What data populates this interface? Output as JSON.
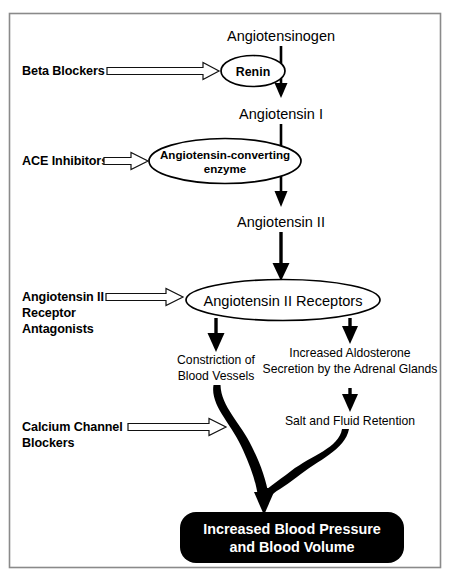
{
  "diagram": {
    "colors": {
      "frame_border": "#8a8a8a",
      "line": "#000000",
      "node_fill": "#ffffff",
      "result_box_fill": "#000000",
      "result_box_text": "#ffffff",
      "hollow_arrow_fill": "#ffffff"
    },
    "pathway_nodes": [
      {
        "id": "angiotensinogen",
        "label": "Angiotensinogen",
        "shape": "text"
      },
      {
        "id": "renin",
        "label": "Renin",
        "shape": "ellipse"
      },
      {
        "id": "angiotensin_1",
        "label": "Angiotensin I",
        "shape": "text"
      },
      {
        "id": "ace",
        "label_line1": "Angiotensin-converting",
        "label_line2": "enzyme",
        "shape": "ellipse"
      },
      {
        "id": "angiotensin_2",
        "label": "Angiotensin II",
        "shape": "text"
      },
      {
        "id": "at2_receptors",
        "label": "Angiotensin II Receptors",
        "shape": "ellipse"
      },
      {
        "id": "constriction",
        "label_line1": "Constriction of",
        "label_line2": "Blood Vessels",
        "shape": "text"
      },
      {
        "id": "aldosterone",
        "label_line1": "Increased Aldosterone",
        "label_line2": "Secretion by the Adrenal Glands",
        "shape": "text"
      },
      {
        "id": "salt_fluid",
        "label": "Salt and Fluid Retention",
        "shape": "text"
      },
      {
        "id": "result",
        "label_line1": "Increased Blood Pressure",
        "label_line2": "and Blood Volume",
        "shape": "rounded-box"
      }
    ],
    "drug_classes": [
      {
        "id": "beta_blockers",
        "lines": [
          "Beta Blockers"
        ],
        "targets": "renin"
      },
      {
        "id": "ace_inhibitors",
        "lines": [
          "ACE Inhibitors"
        ],
        "targets": "ace"
      },
      {
        "id": "arb",
        "lines": [
          "Angiotensin II",
          "Receptor",
          "Antagonists"
        ],
        "targets": "at2_receptors"
      },
      {
        "id": "ccb",
        "lines": [
          "Calcium Channel",
          "Blockers"
        ],
        "targets": "constriction-pathway"
      }
    ],
    "labels": {
      "angiotensinogen": "Angiotensinogen",
      "renin": "Renin",
      "angiotensin_1": "Angiotensin I",
      "ace_line1": "Angiotensin-converting",
      "ace_line2": "enzyme",
      "angiotensin_2": "Angiotensin II",
      "at2_receptors": "Angiotensin II Receptors",
      "constriction_line1": "Constriction of",
      "constriction_line2": "Blood Vessels",
      "aldosterone_line1": "Increased Aldosterone",
      "aldosterone_line2": "Secretion by the Adrenal Glands",
      "salt_fluid": "Salt and Fluid Retention",
      "result_line1": "Increased Blood Pressure",
      "result_line2": "and Blood Volume",
      "beta_blockers": "Beta Blockers",
      "ace_inhibitors": "ACE Inhibitors",
      "arb_line1": "Angiotensin II",
      "arb_line2": "Receptor",
      "arb_line3": "Antagonists",
      "ccb_line1": "Calcium Channel",
      "ccb_line2": "Blockers"
    }
  }
}
